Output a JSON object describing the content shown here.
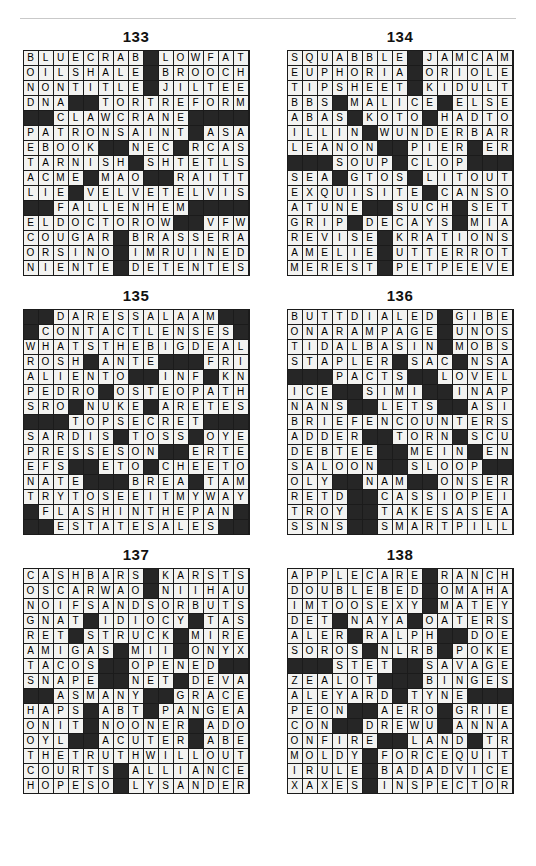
{
  "page": {
    "divider": "top-rule"
  },
  "puzzles": [
    {
      "number": "133",
      "rows": 15,
      "cols": 15,
      "grid": [
        "BLUECRAB#LOWFAT",
        "OILSHALE#BROOCH",
        "NONTITLE#JILTEE",
        "DNA##TORTREFORM",
        "##CLAWCRANE####",
        "PATRONSAINT#ASA",
        "EBOOK##NEC#RCAS",
        "TARNISH#SHTETLS",
        "ACME#MAO##RAITT",
        "LIE#VELVETELVIS",
        "##FALLENHEM####",
        "ELDOCTOROW##VFW",
        "COUGAR#BRASSERA",
        "ORSINO#IMRUINED",
        "NIENTE#DETENTES"
      ]
    },
    {
      "number": "134",
      "rows": 15,
      "cols": 15,
      "grid": [
        "SQUABBLE#JAMCAM",
        "EUPHORIA#ORIOLE",
        "TIPSHEET#KIDULT",
        "BBS#MALICE#ELSE",
        "ABAS#KOTO#HADTO",
        "ILLIN#WUNDERBAR",
        "LEANON##PIER#ERS",
        "###SOUP#CLOP###",
        "SEA#GTOS#LITOUT",
        "EXQUISITE#CANSO",
        "ATUNE##SUCH#SETT",
        "GRIP#DECAYS#MIA",
        "REVISE#KRATIONS",
        "AMELIE#UTTERROT",
        "MEREST#PETPEEVE"
      ]
    },
    {
      "number": "135",
      "rows": 15,
      "cols": 15,
      "grid": [
        "##DARESSALAAM##",
        "#CONTACTLENSES#",
        "WHATSTHEBIGDEAL",
        "ROSH#ANTE###FRIA",
        "ALIENTO##INF#KNT",
        "PEDRO#OSTEOPATH",
        "SRO#NUKE#ARETES",
        "###TOPSECRET###",
        "SARDIS#TOSS#OYE",
        "PRESSESON##ERTES",
        "EFS##ETO#CHEETOS",
        "NATE###BREA#TAMA",
        "TRYTOSEEITMYWAY",
        "#FLASHINTHEPAN#",
        "##ESTATESALES##"
      ]
    },
    {
      "number": "136",
      "rows": 15,
      "cols": 15,
      "grid": [
        "BUTTDIALED#GIBE",
        "ONARAMPAGE#UNOS",
        "TIDALBASIN#MOBS",
        "STAPLER#SAC#NSA",
        "###PACTS##LOVELY",
        "ICE##SIMI##INAPET",
        "NANS##LETS##ASIDE",
        "BRIEFENCOUNTERS",
        "ADDER##TORN#SCUT",
        "DEBTEE##MEIN#ENS",
        "SALOON##SLOOP###",
        "OLY##NAM##ONSERVE",
        "RETD##CASSIOPEIA",
        "TROY##TAKESASEAT",
        "SSNS##SMARTPILLS"
      ]
    },
    {
      "number": "137",
      "rows": 15,
      "cols": 15,
      "grid": [
        "CASHBARS#KARSTS",
        "OSCARWAO#NIIHAU",
        "NOIFSANDSORBUTS",
        "GNAT#IDIOCY#TAS",
        "RET#STRUCK#MIRE",
        "AMIGAS#MII#ONYX",
        "TACOS##OPENED###",
        "SNAPE##NET#DEVAS",
        "##ASMANY##GRACE",
        "HAPS#ABT#PANGEA",
        "ONIT#NOONER#ADO",
        "OYL##ACUTER#ABET",
        "THETRUTHWILLOUT",
        "COURTS#ALLIANCE",
        "HOPESO#LYSANDER"
      ]
    },
    {
      "number": "138",
      "rows": 15,
      "cols": 15,
      "grid": [
        "APPLECARE#RANCH",
        "DOUBLEBED#OMAHA",
        "IMTOOSEXY#MATEY",
        "DET#NAYA#OATERS",
        "ALER#RALPH##DOE",
        "SOROS#NLRB#POKE",
        "###STET##SAVAGED",
        "ZEALOT###BINGES",
        "ALEYARD#TYNE###",
        "PEON##AERO#GRIEG",
        "CON##DREWU#ANNA",
        "ONFIRE##LAND#TRI",
        "MOLDY#FORCEQUIT",
        "IRULE#BADADVICE",
        "XAXES#INSPECTOR"
      ]
    }
  ]
}
